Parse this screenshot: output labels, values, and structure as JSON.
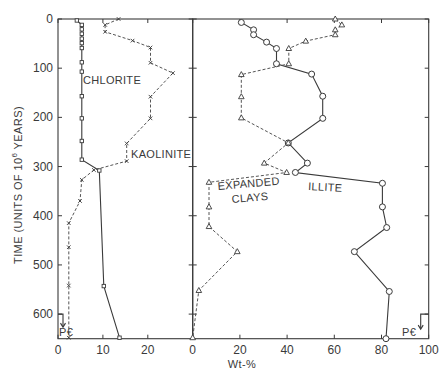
{
  "chart_data": [
    {
      "type": "line",
      "panel": "left",
      "xlabel": "",
      "ylabel": "TIME (UNITS OF 10^6 YEARS)",
      "ylabel_parts": {
        "pre": "TIME (UNITS OF 10",
        "sup": "6",
        "post": " YEARS)"
      },
      "xlim": [
        0,
        30
      ],
      "ylim": [
        0,
        650
      ],
      "y_inverted": true,
      "xticks": [
        0,
        10,
        20
      ],
      "xtick_labels": [
        "0",
        "10",
        "20"
      ],
      "yticks": [
        0,
        100,
        200,
        300,
        400,
        500,
        600
      ],
      "ytick_labels": [
        "0",
        "100",
        "200",
        "300",
        "400",
        "500",
        "600"
      ],
      "boundary_label": "P€",
      "boundary_time": 600,
      "series": [
        {
          "name": "CHLORITE",
          "style": "solid",
          "marker": "square",
          "points": [
            [
              4.2,
              3
            ],
            [
              5.3,
              12
            ],
            [
              5.3,
              21
            ],
            [
              5.3,
              30
            ],
            [
              5.3,
              40
            ],
            [
              5.3,
              49
            ],
            [
              5.3,
              59
            ],
            [
              5.3,
              88
            ],
            [
              5.3,
              107
            ],
            [
              5.3,
              157
            ],
            [
              5.3,
              202
            ],
            [
              5.3,
              248
            ],
            [
              5.3,
              286
            ],
            [
              9.2,
              308
            ],
            [
              10.2,
              543
            ],
            [
              13.7,
              648
            ]
          ]
        },
        {
          "name": "KAOLINITE",
          "style": "dashed",
          "marker": "x",
          "points": [
            [
              13.5,
              0
            ],
            [
              10.5,
              12
            ],
            [
              10.5,
              26
            ],
            [
              16.6,
              44
            ],
            [
              20.6,
              58
            ],
            [
              20.6,
              89
            ],
            [
              25.6,
              110
            ],
            [
              20.6,
              158
            ],
            [
              20.6,
              202
            ],
            [
              15.3,
              253
            ],
            [
              15.3,
              289
            ],
            [
              8.0,
              307
            ],
            [
              5.3,
              327
            ],
            [
              4.9,
              370
            ],
            [
              2.4,
              415
            ],
            [
              2.4,
              464
            ],
            [
              2.4,
              542
            ],
            [
              2.4,
              648
            ]
          ]
        }
      ]
    },
    {
      "type": "line",
      "panel": "right",
      "xlabel": "Wt-%",
      "xlim": [
        0,
        100
      ],
      "ylim": [
        0,
        650
      ],
      "y_inverted": true,
      "xticks": [
        0,
        20,
        40,
        60,
        80,
        100
      ],
      "xtick_labels": [
        "0",
        "20",
        "40",
        "60",
        "80",
        "100"
      ],
      "boundary_label": "P€",
      "boundary_time": 600,
      "series": [
        {
          "name": "ILLITE",
          "style": "solid",
          "marker": "circle",
          "points": [
            [
              20.6,
              7
            ],
            [
              25.8,
              22
            ],
            [
              25.8,
              32
            ],
            [
              31.3,
              47
            ],
            [
              35.5,
              60
            ],
            [
              35.5,
              91
            ],
            [
              50.4,
              112
            ],
            [
              55.1,
              157
            ],
            [
              55.1,
              202
            ],
            [
              40.5,
              252
            ],
            [
              48.6,
              293
            ],
            [
              43.5,
              312
            ],
            [
              80.4,
              334
            ],
            [
              80.4,
              382
            ],
            [
              82.2,
              424
            ],
            [
              68.5,
              473
            ],
            [
              83.3,
              554
            ],
            [
              81.9,
              650
            ]
          ]
        },
        {
          "name": "EXPANDED CLAYS",
          "label_lines": [
            "EXPANDED",
            "CLAYS"
          ],
          "style": "dashed",
          "marker": "triangle",
          "points": [
            [
              60.4,
              0
            ],
            [
              63.2,
              12
            ],
            [
              60.4,
              22
            ],
            [
              60.4,
              32
            ],
            [
              47.9,
              45
            ],
            [
              40.7,
              60
            ],
            [
              40.7,
              91
            ],
            [
              20.6,
              113
            ],
            [
              20.6,
              158
            ],
            [
              20.6,
              201
            ],
            [
              40.5,
              252
            ],
            [
              30.3,
              293
            ],
            [
              39.8,
              312
            ],
            [
              6.9,
              332
            ],
            [
              6.9,
              382
            ],
            [
              6.9,
              422
            ],
            [
              18.9,
              473
            ],
            [
              2.6,
              552
            ],
            [
              0,
              648
            ]
          ]
        }
      ]
    }
  ]
}
